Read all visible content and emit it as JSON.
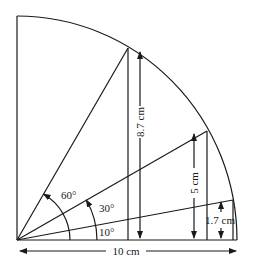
{
  "diagram": {
    "type": "quarter-circle trigonometry figure",
    "radius_label": "10 cm",
    "angles": [
      {
        "label": "60°",
        "degrees": 60,
        "height_label": "8.7 cm"
      },
      {
        "label": "30°",
        "degrees": 30,
        "height_label": "5 cm"
      },
      {
        "label": "10°",
        "degrees": 10,
        "height_label": "1.7 cm"
      }
    ],
    "colors": {
      "line": "#1a1a1a",
      "background": "#ffffff"
    }
  }
}
